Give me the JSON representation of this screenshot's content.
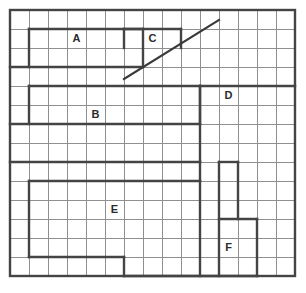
{
  "canvas": {
    "width": 306,
    "height": 293,
    "background": "#ffffff"
  },
  "grid": {
    "origin_x": 10,
    "origin_y": 10,
    "cell_size": 19,
    "columns": 15,
    "rows": 14,
    "thin_line_color": "#8f8f8f",
    "thin_line_width": 1,
    "bold_line_color": "#444444",
    "bold_line_width": 2.4,
    "outer_border_color": "#444444",
    "outer_border_width": 2.4
  },
  "labels": [
    {
      "name": "region-label-a",
      "text": "A",
      "col": 3.5,
      "row": 1.5
    },
    {
      "name": "region-label-b",
      "text": "B",
      "col": 4.5,
      "row": 5.5
    },
    {
      "name": "region-label-c",
      "text": "C",
      "col": 7.5,
      "row": 1.5
    },
    {
      "name": "region-label-d",
      "text": "D",
      "col": 11.5,
      "row": 4.5
    },
    {
      "name": "region-label-e",
      "text": "E",
      "col": 5.5,
      "row": 10.5
    },
    {
      "name": "region-label-f",
      "text": "F",
      "col": 11.5,
      "row": 12.5
    }
  ],
  "bold_segments": [
    {
      "name": "bold-h-a-top",
      "x1": 1,
      "y1": 1,
      "x2": 7,
      "y2": 1
    },
    {
      "name": "bold-v-a-left",
      "x1": 1,
      "y1": 1,
      "x2": 1,
      "y2": 3
    },
    {
      "name": "bold-v-a-right",
      "x1": 7,
      "y1": 1,
      "x2": 7,
      "y2": 3
    },
    {
      "name": "bold-h-a-bottom",
      "x1": 0,
      "y1": 3,
      "x2": 7,
      "y2": 3
    },
    {
      "name": "bold-h-c-top",
      "x1": 6,
      "y1": 1,
      "x2": 9,
      "y2": 1
    },
    {
      "name": "bold-v-c-left",
      "x1": 6,
      "y1": 1,
      "x2": 6,
      "y2": 2
    },
    {
      "name": "bold-v-c-right",
      "x1": 9,
      "y1": 1,
      "x2": 9,
      "y2": 2
    },
    {
      "name": "bold-h-b-top",
      "x1": 1,
      "y1": 4,
      "x2": 10,
      "y2": 4
    },
    {
      "name": "bold-v-b-left",
      "x1": 1,
      "y1": 4,
      "x2": 1,
      "y2": 6
    },
    {
      "name": "bold-h-b-bottom",
      "x1": 0,
      "y1": 6,
      "x2": 10,
      "y2": 6
    },
    {
      "name": "bold-v-b-right",
      "x1": 10,
      "y1": 4,
      "x2": 10,
      "y2": 6
    },
    {
      "name": "bold-h-d-top",
      "x1": 10,
      "y1": 4,
      "x2": 15,
      "y2": 4
    },
    {
      "name": "bold-v-d-left",
      "x1": 10,
      "y1": 4,
      "x2": 10,
      "y2": 8
    },
    {
      "name": "bold-h-mid-1",
      "x1": 0,
      "y1": 8,
      "x2": 10,
      "y2": 8
    },
    {
      "name": "bold-v-mid-1",
      "x1": 10,
      "y1": 8,
      "x2": 10,
      "y2": 9
    },
    {
      "name": "bold-h-mid-2",
      "x1": 1,
      "y1": 9,
      "x2": 10,
      "y2": 9
    },
    {
      "name": "bold-v-e-left",
      "x1": 1,
      "y1": 9,
      "x2": 1,
      "y2": 13
    },
    {
      "name": "bold-h-e-bottom",
      "x1": 1,
      "y1": 13,
      "x2": 6,
      "y2": 13
    },
    {
      "name": "bold-v-e-right",
      "x1": 6,
      "y1": 13,
      "x2": 6,
      "y2": 14
    },
    {
      "name": "bold-v-col10-lower",
      "x1": 10,
      "y1": 9,
      "x2": 10,
      "y2": 14
    },
    {
      "name": "bold-v-col11-upper",
      "x1": 11,
      "y1": 8,
      "x2": 11,
      "y2": 14
    },
    {
      "name": "bold-h-col11-top",
      "x1": 11,
      "y1": 8,
      "x2": 12,
      "y2": 8
    },
    {
      "name": "bold-v-col12-f",
      "x1": 12,
      "y1": 8,
      "x2": 12,
      "y2": 11
    },
    {
      "name": "bold-h-f-top",
      "x1": 11,
      "y1": 11,
      "x2": 13,
      "y2": 11
    },
    {
      "name": "bold-v-f-right",
      "x1": 13,
      "y1": 11,
      "x2": 13,
      "y2": 14
    },
    {
      "name": "bold-h-f-bottom",
      "x1": 6,
      "y1": 14,
      "x2": 13,
      "y2": 14
    }
  ],
  "diagonal": {
    "name": "diagonal-line",
    "x1": 124,
    "y1": 79,
    "x2": 219,
    "y2": 20,
    "color": "#3a3a3a",
    "width": 2.2
  }
}
